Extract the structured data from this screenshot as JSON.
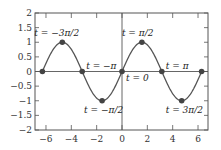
{
  "chart_data": {
    "type": "line",
    "title": "",
    "xlabel": "",
    "ylabel": "",
    "xlim": [
      -7,
      7
    ],
    "ylim": [
      -2,
      2
    ],
    "grid": false,
    "function": "sin(t)",
    "xticks": [
      -6,
      -4,
      -2,
      0,
      2,
      4,
      6
    ],
    "xtick_labels": [
      "−6",
      "−4",
      "−2",
      "0",
      "2",
      "4",
      "6"
    ],
    "yticks": [
      -2,
      -1.5,
      -1,
      -0.5,
      0,
      0.5,
      1,
      1.5,
      2
    ],
    "ytick_labels": [
      "−2",
      "−1.5",
      "−1",
      "−0.5",
      "0",
      "0.5",
      "1",
      "1.5",
      "2"
    ],
    "series": [
      {
        "name": "sin(t)",
        "x_range": [
          -6.2832,
          6.2832
        ],
        "color": "#555555"
      }
    ],
    "points": [
      {
        "x": -6.2832,
        "y": 0
      },
      {
        "x": -4.7124,
        "y": 1
      },
      {
        "x": -3.1416,
        "y": 0
      },
      {
        "x": -1.5708,
        "y": -1
      },
      {
        "x": 0,
        "y": 0
      },
      {
        "x": 1.5708,
        "y": 1
      },
      {
        "x": 3.1416,
        "y": 0
      },
      {
        "x": 4.7124,
        "y": -1
      },
      {
        "x": 6.2832,
        "y": 0
      }
    ],
    "annotations": [
      {
        "text": "t = −3π/2",
        "x": -4.7124,
        "y": 1
      },
      {
        "text": "t = −π",
        "x": -3.1416,
        "y": 0
      },
      {
        "text": "t = −π/2",
        "x": -1.5708,
        "y": -1
      },
      {
        "text": "t = 0",
        "x": 0,
        "y": 0
      },
      {
        "text": "t = π/2",
        "x": 1.5708,
        "y": 1
      },
      {
        "text": "t = π",
        "x": 3.1416,
        "y": 0
      },
      {
        "text": "t = 3π/2",
        "x": 4.7124,
        "y": -1
      }
    ]
  },
  "style": {
    "curve_color": "#555555",
    "point_color": "#444444",
    "axis_color": "#555555"
  }
}
